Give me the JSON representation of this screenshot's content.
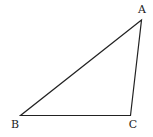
{
  "diagram": {
    "type": "triangle",
    "stroke_color": "#222222",
    "background": "#ffffff",
    "vertices": [
      {
        "label": "A",
        "x": 141.5,
        "y": 20,
        "label_x": 142,
        "label_y": 13
      },
      {
        "label": "B",
        "x": 20.5,
        "y": 115.5,
        "label_x": 15,
        "label_y": 128
      },
      {
        "label": "C",
        "x": 130.5,
        "y": 115.5,
        "label_x": 133,
        "label_y": 128
      }
    ],
    "edges": [
      {
        "from": "A",
        "to": "B"
      },
      {
        "from": "B",
        "to": "C"
      },
      {
        "from": "C",
        "to": "A"
      }
    ]
  }
}
